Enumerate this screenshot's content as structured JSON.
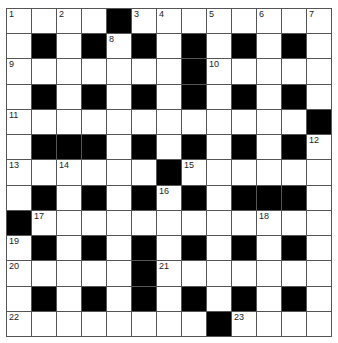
{
  "puzzle": {
    "rows": 13,
    "cols": 13,
    "layout": [
      "W.W.#WW.W.W.W",
      "W#W#W#W#W#W#W",
      "WWWWWWW#WWWWW",
      "W#W#W#W#W#W#W",
      "WWWWWWWWWWWW#",
      "W###W#W#W#W#W",
      "WWWWWW#WWWWWW",
      "W#W#W#W#W###W",
      "#WWWWWWWWWWWW",
      "W#W#W#W#W#W#W",
      "WWWWW#WWWWWWW",
      "W#W#W#W#W#W#W",
      "WWWWWWWW#WWWW"
    ],
    "numbers": [
      {
        "row": 0,
        "col": 0,
        "n": "1"
      },
      {
        "row": 0,
        "col": 2,
        "n": "2"
      },
      {
        "row": 0,
        "col": 5,
        "n": "3"
      },
      {
        "row": 0,
        "col": 6,
        "n": "4"
      },
      {
        "row": 0,
        "col": 8,
        "n": "5"
      },
      {
        "row": 0,
        "col": 10,
        "n": "6"
      },
      {
        "row": 0,
        "col": 12,
        "n": "7"
      },
      {
        "row": 1,
        "col": 4,
        "n": "8"
      },
      {
        "row": 2,
        "col": 0,
        "n": "9"
      },
      {
        "row": 2,
        "col": 8,
        "n": "10"
      },
      {
        "row": 4,
        "col": 0,
        "n": "11"
      },
      {
        "row": 5,
        "col": 12,
        "n": "12"
      },
      {
        "row": 6,
        "col": 0,
        "n": "13"
      },
      {
        "row": 6,
        "col": 2,
        "n": "14"
      },
      {
        "row": 6,
        "col": 7,
        "n": "15"
      },
      {
        "row": 7,
        "col": 6,
        "n": "16"
      },
      {
        "row": 8,
        "col": 1,
        "n": "17"
      },
      {
        "row": 8,
        "col": 10,
        "n": "18"
      },
      {
        "row": 9,
        "col": 0,
        "n": "19"
      },
      {
        "row": 10,
        "col": 0,
        "n": "20"
      },
      {
        "row": 10,
        "col": 6,
        "n": "21"
      },
      {
        "row": 12,
        "col": 0,
        "n": "22"
      },
      {
        "row": 12,
        "col": 9,
        "n": "23"
      }
    ],
    "colors": {
      "black_square": "#000000",
      "white_square": "#ffffff",
      "grid_line": "#555555"
    }
  }
}
